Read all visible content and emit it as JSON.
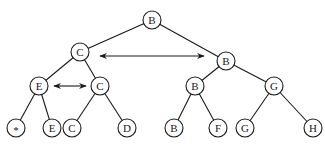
{
  "diagram": {
    "type": "binary-tree",
    "nodes": [
      {
        "id": "n0",
        "label": "B",
        "x": 152,
        "y": 20
      },
      {
        "id": "n1",
        "label": "C",
        "x": 80,
        "y": 52
      },
      {
        "id": "n2",
        "label": "B",
        "x": 226,
        "y": 61
      },
      {
        "id": "n3",
        "label": "E",
        "x": 39,
        "y": 86
      },
      {
        "id": "n4",
        "label": "C",
        "x": 100,
        "y": 86
      },
      {
        "id": "n5",
        "label": "B",
        "x": 195,
        "y": 86
      },
      {
        "id": "n6",
        "label": "G",
        "x": 274,
        "y": 86
      },
      {
        "id": "n7",
        "label": "*",
        "x": 16,
        "y": 128
      },
      {
        "id": "n8",
        "label": "E",
        "x": 52,
        "y": 128
      },
      {
        "id": "n9",
        "label": "C",
        "x": 72,
        "y": 128
      },
      {
        "id": "n10",
        "label": "D",
        "x": 127,
        "y": 128
      },
      {
        "id": "n11",
        "label": "B",
        "x": 174,
        "y": 128
      },
      {
        "id": "n12",
        "label": "F",
        "x": 218,
        "y": 128
      },
      {
        "id": "n13",
        "label": "G",
        "x": 245,
        "y": 128
      },
      {
        "id": "n14",
        "label": "H",
        "x": 313,
        "y": 128
      }
    ],
    "edges": [
      [
        "n0",
        "n1"
      ],
      [
        "n0",
        "n2"
      ],
      [
        "n1",
        "n3"
      ],
      [
        "n1",
        "n4"
      ],
      [
        "n2",
        "n5"
      ],
      [
        "n2",
        "n6"
      ],
      [
        "n3",
        "n7"
      ],
      [
        "n3",
        "n8"
      ],
      [
        "n4",
        "n9"
      ],
      [
        "n4",
        "n10"
      ],
      [
        "n5",
        "n11"
      ],
      [
        "n5",
        "n12"
      ],
      [
        "n6",
        "n13"
      ],
      [
        "n6",
        "n14"
      ]
    ],
    "swap_arrows": [
      {
        "from": "n1",
        "to": "n2",
        "x1": 100,
        "y1": 56,
        "x2": 204,
        "y2": 56
      },
      {
        "from": "n3",
        "to": "n4",
        "x1": 54,
        "y1": 86,
        "x2": 86,
        "y2": 86
      }
    ],
    "node_radius": 9
  }
}
